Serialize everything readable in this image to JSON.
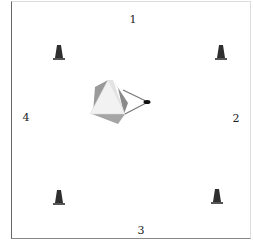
{
  "diagram": {
    "labels": [
      {
        "id": "1",
        "text": "1",
        "x": 133,
        "y": 19
      },
      {
        "id": "2",
        "text": "2",
        "x": 236,
        "y": 118
      },
      {
        "id": "3",
        "text": "3",
        "x": 141,
        "y": 230
      },
      {
        "id": "4",
        "text": "4",
        "x": 26,
        "y": 117
      }
    ],
    "cones": [
      {
        "position": "top-left",
        "x": 59,
        "y": 53
      },
      {
        "position": "top-right",
        "x": 221,
        "y": 53
      },
      {
        "position": "bottom-left",
        "x": 59,
        "y": 198
      },
      {
        "position": "bottom-right",
        "x": 217,
        "y": 198
      }
    ],
    "central_object": "pyramid",
    "pointer_target": {
      "x": 147,
      "y": 102
    },
    "colors": {
      "cone": "#2f2f2f",
      "pyramid_light": "#f2f2f2",
      "pyramid_dark": "#8a8a8a",
      "frame": "#666666"
    }
  }
}
